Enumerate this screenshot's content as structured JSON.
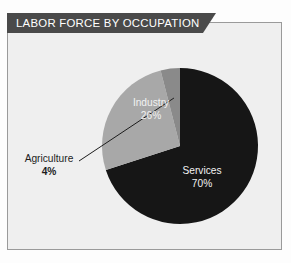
{
  "banner": {
    "title": "LABOR FORCE BY OCCUPATION",
    "background": "#4a4a4a",
    "text_color": "#ffffff"
  },
  "card": {
    "background": "#efefef",
    "border_color": "#9a9a9a"
  },
  "chart_data": {
    "type": "pie",
    "title": "LABOR FORCE BY OCCUPATION",
    "categories": [
      "Services",
      "Industry",
      "Agriculture"
    ],
    "values": [
      70,
      26,
      4
    ],
    "unit": "%",
    "labels": [
      {
        "name": "Services",
        "value": "70%",
        "color": "#161616",
        "text_color": "#f2f2f2",
        "position": "inside"
      },
      {
        "name": "Industry",
        "value": "26%",
        "color": "#a8a8a8",
        "text_color": "#f2f2f2",
        "position": "inside"
      },
      {
        "name": "Agriculture",
        "value": "4%",
        "color": "#8a8a8a",
        "text_color": "#1d1d1d",
        "position": "callout"
      }
    ],
    "start_angle": 0,
    "direction": "clockwise",
    "legend": "none",
    "grid": false,
    "colors": {
      "services": "#161616",
      "industry": "#a8a8a8",
      "agriculture": "#8a8a8a",
      "leader_line": "#1d1d1d"
    }
  }
}
